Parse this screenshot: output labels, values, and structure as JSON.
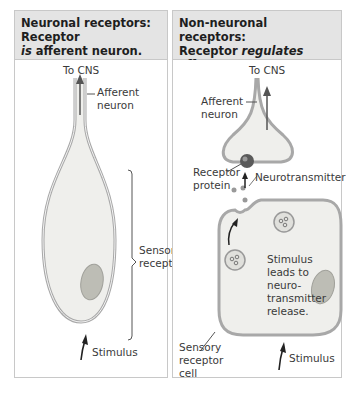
{
  "figure": {
    "left_panel": {
      "header": {
        "line1": "Neuronal receptors: Receptor",
        "line2_em": "is",
        "line2_rest": " afferent neuron."
      },
      "labels": {
        "to_cns": "To CNS",
        "afferent_neuron_1": "Afferent",
        "afferent_neuron_2": "neuron",
        "sensory_receptor_1": "Sensory",
        "sensory_receptor_2": "receptor",
        "stimulus": "Stimulus"
      }
    },
    "right_panel": {
      "header": {
        "line1": "Non-neuronal receptors:",
        "line2_pre": "Receptor ",
        "line2_em": "regulates",
        "line2_rest": " afferent",
        "line3": "neuron."
      },
      "labels": {
        "to_cns": "To CNS",
        "afferent_neuron_1": "Afferent",
        "afferent_neuron_2": "neuron",
        "receptor_protein_1": "Receptor",
        "receptor_protein_2": "protein",
        "neurotransmitter": "Neurotransmitter",
        "stimulus_leads_1": "Stimulus",
        "stimulus_leads_2": "leads to",
        "stimulus_leads_3": "neuro-",
        "stimulus_leads_4": "transmitter",
        "stimulus_leads_5": "release.",
        "sensory_receptor_cell_1": "Sensory",
        "sensory_receptor_cell_2": "receptor",
        "sensory_receptor_cell_3": "cell",
        "stimulus": "Stimulus"
      }
    },
    "colors": {
      "header_bg": "#e4e4e4",
      "border": "#c8c8c8",
      "cell_fill": "#eeeeea",
      "cell_outline": "#a8a8a8",
      "nucleus": "#b8b8b0",
      "receptor_protein": "#555555"
    }
  }
}
